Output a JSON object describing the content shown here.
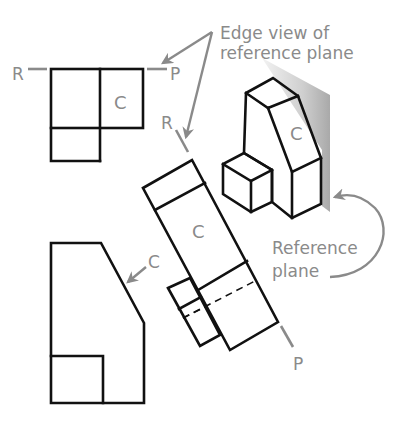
{
  "diagram": {
    "type": "auxiliary-view-reference-plane",
    "annotations": {
      "edge_view": {
        "line1": "Edge view of",
        "line2": "reference plane"
      },
      "reference_plane": {
        "line1": "Reference",
        "line2": "plane"
      }
    },
    "top_view": {
      "labels": {
        "left": "R",
        "right": "P",
        "face": "C"
      }
    },
    "auxiliary_view": {
      "labels": {
        "top": "R",
        "bottom": "P",
        "face": "C"
      }
    },
    "front_view": {
      "labels": {
        "face": "C"
      }
    },
    "pictorial_view": {
      "labels": {
        "face": "C"
      }
    },
    "colors": {
      "object_lines": "#111111",
      "annotation": "#8a8a8a",
      "plane_fill": "#c8c8c8"
    }
  }
}
